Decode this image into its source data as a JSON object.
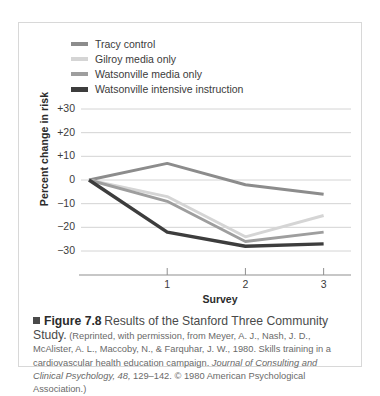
{
  "figure": {
    "number": "Figure 7.8",
    "title": "Results of the Stanford Three Community Study.",
    "credit_part1": "(Reprinted, with permission, from Meyer, A. J., Nash, J. D., McAlister, A. L., Maccoby, N., & Farquhar, J. W., 1980. Skills training in a cardiovascular health education campaign. ",
    "credit_journal": "Journal of Consulting and Clinical Psychology, 48,",
    "credit_part2": " 129–142. © 1980 American Psychological Association.)"
  },
  "chart_data": {
    "type": "line",
    "title": "",
    "xlabel": "Survey",
    "ylabel": "Percent change in risk",
    "x": [
      0,
      1,
      2,
      3
    ],
    "x_tick_values": [
      1,
      2,
      3
    ],
    "x_tick_labels": [
      "1",
      "2",
      "3"
    ],
    "xlim": [
      0,
      3.35
    ],
    "ylim": [
      -33,
      33
    ],
    "y_ticks": [
      30,
      20,
      10,
      0,
      -10,
      -20,
      -30
    ],
    "y_tick_labels": [
      "+30",
      "+20",
      "+10",
      "0",
      "−10",
      "−20",
      "−30"
    ],
    "grid": "horizontal",
    "legend_position": "top-left",
    "series": [
      {
        "name": "Tracy control",
        "color": "#8c8c8c",
        "values": [
          0,
          7,
          -2,
          -6
        ]
      },
      {
        "name": "Gilroy media only",
        "color": "#d5d5d5",
        "values": [
          0,
          -7,
          -24,
          -15
        ]
      },
      {
        "name": "Watsonville media only",
        "color": "#9e9e9e",
        "values": [
          0,
          -9,
          -26,
          -22
        ]
      },
      {
        "name": "Watsonville intensive instruction",
        "color": "#3d3d3d",
        "values": [
          0,
          -22,
          -28,
          -27
        ]
      }
    ]
  },
  "axis": {
    "y_title": "Percent change in risk",
    "x_title": "Survey"
  }
}
